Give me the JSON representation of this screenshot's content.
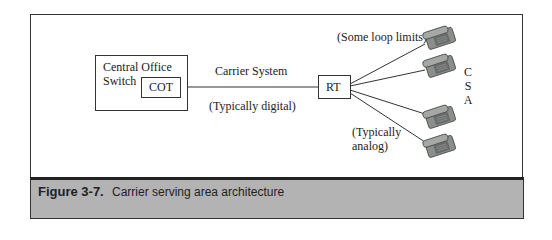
{
  "diagram": {
    "central_office": {
      "label_line1": "Central Office",
      "label_line2": "Switch"
    },
    "cot": {
      "label": "COT"
    },
    "carrier_system": {
      "label": "Carrier System",
      "sublabel": "(Typically digital)"
    },
    "rt": {
      "label": "RT"
    },
    "loop_note": "(Some loop limits)",
    "analog_note_line1": "(Typically",
    "analog_note_line2": "analog)",
    "csa_letters": [
      "C",
      "S",
      "A"
    ],
    "phones": [
      {
        "name": "telephone-1"
      },
      {
        "name": "telephone-2"
      },
      {
        "name": "telephone-3"
      },
      {
        "name": "telephone-4"
      }
    ]
  },
  "caption": {
    "number": "Figure 3-7.",
    "text": "Carrier serving area architecture"
  },
  "colors": {
    "caption_bg": "#b3b3b3",
    "line": "#333333",
    "phone_body": "#8a8f8c"
  }
}
